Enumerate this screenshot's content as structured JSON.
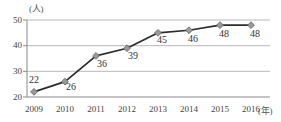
{
  "chart_data": {
    "type": "line",
    "title": "",
    "subtitle": "",
    "xlabel": "(年)",
    "ylabel": "(人)",
    "categories": [
      "2009",
      "2010",
      "2011",
      "2012",
      "2013",
      "2014",
      "2015",
      "2016"
    ],
    "values": [
      22,
      26,
      36,
      39,
      45,
      46,
      48,
      48
    ],
    "series": [
      {
        "name": "",
        "values": [
          22,
          26,
          36,
          39,
          45,
          46,
          48,
          48
        ]
      }
    ],
    "point_labels": [
      "22",
      "26",
      "36",
      "39",
      "45",
      "46",
      "48",
      "48"
    ],
    "ytick_labels": [
      "50",
      "40",
      "30",
      "20"
    ],
    "ytick_values": [
      50,
      40,
      30,
      20
    ],
    "ylim": [
      20,
      50
    ],
    "xlim_categories": 8,
    "grid": true,
    "grid_axis": "y",
    "legend": false,
    "legend_position": "none",
    "colors": {
      "line": "#2b2b2b",
      "marker_fill": "#9a9a9a",
      "marker_stroke": "#6b6b6b",
      "grid": "#b8b8b8",
      "axis": "#8a8a8a",
      "text": "#3a3a3a",
      "background": "#ffffff"
    }
  }
}
